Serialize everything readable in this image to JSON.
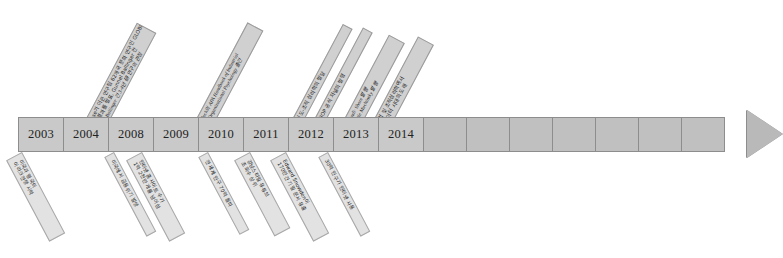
{
  "diagram": {
    "type": "timeline-arrow",
    "title": "",
    "orientation": "horizontal-right",
    "colors": {
      "bar_fill": "#c6c6c6",
      "bar_border": "#8d8d8d",
      "callout_up_fill": "#d0d0d0",
      "callout_down_fill": "#e2e2e2",
      "callout_border": "#9a9a9a",
      "arrow_fill": "#b9b9b9",
      "text": "#1a1a1a",
      "background": "#ffffff"
    }
  },
  "timeline": {
    "years": [
      "2003",
      "2004",
      "2008",
      "2009",
      "2010",
      "2011",
      "2012",
      "2013",
      "2014"
    ],
    "blank_cells": 7,
    "arrowhead": "right-arrow-head"
  },
  "callouts_above": [
    {
      "anchor_year": "2004",
      "lines": [
        "House가 이끈 연구팀 62개국 문화 연구인 GLOBE",
        "연구 결과를 발표, Gunnel Ballinger 간",
        "Gunnel Ballinger 간 3-4년 研 연구의 관점"
      ]
    },
    {
      "anchor_year": "2010",
      "lines": [
        "Zedeck의 APA Handbook of Industrial",
        "and Organizational Psychology 출간"
      ]
    },
    {
      "anchor_year": "2012",
      "lines": [
        "인도-조직 심리학의 발달"
      ]
    },
    {
      "anchor_year": "2013",
      "lines": [
        "SJOP 공식 저널의 발행"
      ]
    },
    {
      "anchor_year": "2013b",
      "lines": [
        "Lunndi· Shore 발행",
        "Double Muchinsky 발행"
      ]
    },
    {
      "anchor_year": "2014",
      "lines": [
        "산업 및 조직심리학에서",
        "빅데이터 시대의 도래"
      ]
    }
  ],
  "callouts_below": [
    {
      "anchor_year": "2003",
      "lines": [
        "미국과 영국의",
        "이라크전쟁 시작"
      ]
    },
    {
      "anchor_year": "2008",
      "lines": [
        "미국에서 금융위기 발생"
      ]
    },
    {
      "anchor_year": "2009",
      "lines": [
        "인터넷 홈사이트 수가",
        "1억 2천만 개를 넘어섬"
      ]
    },
    {
      "anchor_year": "2011",
      "lines": [
        "전 세계 인구 70억 돌파"
      ]
    },
    {
      "anchor_year": "2012",
      "lines": [
        "강남스타일 유튜브",
        "조회수 상위"
      ]
    },
    {
      "anchor_year": "2013",
      "lines": [
        "Edward Snowden이",
        "170만건 기밀 문서 유출"
      ]
    },
    {
      "anchor_year": "2014",
      "lines": [
        "30억 인구가 인터넷 사용"
      ]
    }
  ]
}
